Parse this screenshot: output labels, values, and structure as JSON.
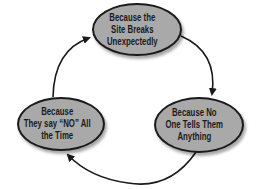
{
  "diagram": {
    "type": "cycle",
    "nodes": [
      {
        "id": "top",
        "label": "Because the\nSite Breaks\nUnexpectedly"
      },
      {
        "id": "right",
        "label": "Because No\nOne Tells Them\nAnything"
      },
      {
        "id": "left",
        "label": "Because\nThey say “NO” All\nthe Time"
      }
    ],
    "edges": [
      {
        "from": "top",
        "to": "right"
      },
      {
        "from": "right",
        "to": "left"
      },
      {
        "from": "left",
        "to": "top"
      }
    ],
    "colors": {
      "node_fill": "#a9a9a9",
      "node_border": "#1a1a1a",
      "arrow": "#1a1a1a",
      "background": "#ffffff"
    }
  }
}
